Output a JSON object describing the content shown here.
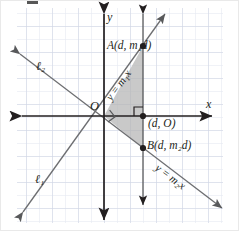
{
  "figure": {
    "kind": "coordinate-plane-geometry-diagram",
    "background": "#ffffff",
    "grid_color": "#dfe3ef",
    "grid_major_color": "#c8cee0",
    "axis_color": "#231f20",
    "line_color": "#6d6e71",
    "shade_color": "#b3b3b3",
    "point_color": "#231f20"
  },
  "axes": {
    "x_label": "x",
    "y_label": "y",
    "origin_label": "O"
  },
  "labels": {
    "point_a": "A(d, m₁d)",
    "point_b": "B(d, m₂d)",
    "foot": "(d, O)",
    "line1_name": "ℓ₁",
    "line2_name": "ℓ₂",
    "line1_equation": "y = m₁x",
    "line2_equation": "y = m₂x"
  },
  "points": [
    {
      "name": "O",
      "label": "O",
      "x": 104,
      "y": 116
    },
    {
      "name": "A",
      "label": "A(d, m₁d)",
      "x": 143,
      "y": 46
    },
    {
      "name": "B",
      "label": "B(d, m₂d)",
      "x": 143,
      "y": 148
    },
    {
      "name": "foot",
      "label": "(d, O)",
      "x": 143,
      "y": 116
    }
  ],
  "annotations": {
    "right_angle_at_origin": true,
    "right_angle_at_foot": true,
    "shaded_triangle_vertices": "O, A, B"
  }
}
